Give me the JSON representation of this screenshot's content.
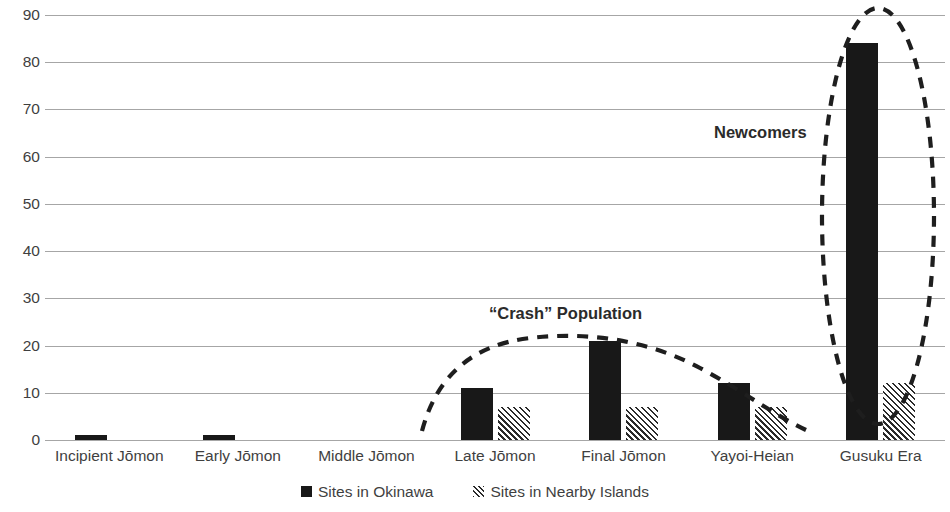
{
  "chart_data": {
    "type": "bar",
    "title": "",
    "subtitle": "",
    "xlabel": "",
    "ylabel": "",
    "ylim": [
      0,
      90
    ],
    "ytick_values": [
      0,
      10,
      20,
      30,
      40,
      50,
      60,
      70,
      80,
      90
    ],
    "ytick_labels": [
      "0",
      "10",
      "20",
      "30",
      "40",
      "50",
      "60",
      "70",
      "80",
      "90"
    ],
    "grid": true,
    "legend_position": "bottom",
    "categories": [
      "Incipient Jōmon",
      "Early Jōmon",
      "Middle Jōmon",
      "Late Jōmon",
      "Final Jōmon",
      "Yayoi-Heian",
      "Gusuku Era"
    ],
    "series": [
      {
        "name": "Sites in Okinawa",
        "fill": "solid-black",
        "color": "#181818",
        "values": [
          1,
          1,
          0,
          11,
          21,
          12,
          84
        ]
      },
      {
        "name": "Sites in Nearby Islands",
        "fill": "diagonal-hatch",
        "color": "#2b2b2b",
        "values": [
          0,
          0,
          0,
          7,
          7,
          7,
          12
        ]
      }
    ],
    "annotations": [
      {
        "id": "crash-population",
        "text": "“Crash” Population",
        "shape": "dashed-arc"
      },
      {
        "id": "newcomers",
        "text": "Newcomers",
        "shape": "dashed-ellipse"
      }
    ]
  },
  "legend": {
    "items": [
      {
        "label": "Sites in Okinawa",
        "swatch": "solid-black"
      },
      {
        "label": "Sites in Nearby Islands",
        "swatch": "diagonal-hatch"
      }
    ]
  },
  "colors": {
    "bar_okinawa": "#181818",
    "bar_nearby_hatch": "#2b2b2b",
    "gridline": "#a6a6a6",
    "text": "#3f3f3f",
    "annotation": "#2b2b2b",
    "background": "#ffffff"
  }
}
